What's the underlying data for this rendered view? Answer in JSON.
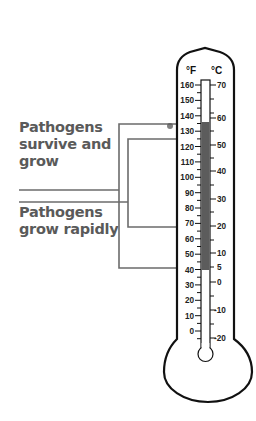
{
  "labels": {
    "survive_grow": [
      "Pathogens",
      "survive and",
      "grow"
    ],
    "grow_rapidly": [
      "Pathogens",
      "grow rapidly"
    ]
  },
  "thermometer": {
    "unit_f": "°F",
    "unit_c": "°C",
    "fahrenheit_ticks": [
      "160",
      "150",
      "140",
      "130",
      "120",
      "110",
      "100",
      "90",
      "80",
      "70",
      "60",
      "50",
      "40",
      "30",
      "20",
      "10",
      "0"
    ],
    "celsius_ticks": [
      "70",
      "60",
      "50",
      "40",
      "30",
      "20",
      "10",
      "5",
      "0",
      "-10",
      "-20"
    ],
    "fill_range_f": [
      41,
      135
    ],
    "fill_color": "#5c5c5c"
  },
  "ranges": {
    "survive_grow_f": [
      41,
      135
    ],
    "grow_rapidly_f": [
      70,
      125
    ]
  },
  "colors": {
    "label_text": "#5a5a5a",
    "bracket_line": "#6b6b6b",
    "outline": "#111111"
  }
}
